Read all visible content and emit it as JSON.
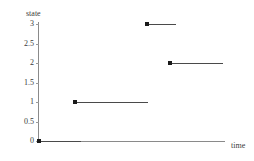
{
  "chart_data": {
    "type": "line",
    "title": "",
    "xlabel": "time",
    "ylabel": "state",
    "grid": false,
    "legend": null,
    "ylim": [
      0,
      3
    ],
    "yticks": [
      0,
      0.5,
      1,
      1.5,
      2,
      2.5,
      3
    ],
    "ytick_labels": [
      "0",
      "0.5",
      "1",
      "1.5",
      "2",
      "2.5",
      "3"
    ],
    "xticks": [],
    "xtick_labels": [],
    "series": [
      {
        "name": "state",
        "style": "step-post",
        "marker": "filled-square",
        "segments": [
          {
            "state": 0,
            "x_start": 0.0,
            "x_end": 0.23,
            "marker_at_start": true
          },
          {
            "state": 1,
            "x_start": 0.19,
            "x_end": 0.59,
            "marker_at_start": true
          },
          {
            "state": 3,
            "x_start": 0.58,
            "x_end": 0.74,
            "marker_at_start": true
          },
          {
            "state": 2,
            "x_start": 0.7,
            "x_end": 0.99,
            "marker_at_start": true
          }
        ]
      }
    ],
    "transition_order": [
      0,
      1,
      3,
      2
    ]
  },
  "axes": {
    "y_title": "state",
    "x_title": "time"
  },
  "ticks": {
    "y": [
      {
        "label": "3",
        "value": 3
      },
      {
        "label": "2.5",
        "value": 2.5
      },
      {
        "label": "2",
        "value": 2
      },
      {
        "label": "1.5",
        "value": 1.5
      },
      {
        "label": "1",
        "value": 1
      },
      {
        "label": "0.5",
        "value": 0.5
      },
      {
        "label": "0",
        "value": 0
      }
    ]
  },
  "colors": {
    "axis": "#8a8a8a",
    "series": "#4a4a4a",
    "marker": "#1a1a1a",
    "text": "#3a3a3a",
    "background": "#ffffff"
  }
}
